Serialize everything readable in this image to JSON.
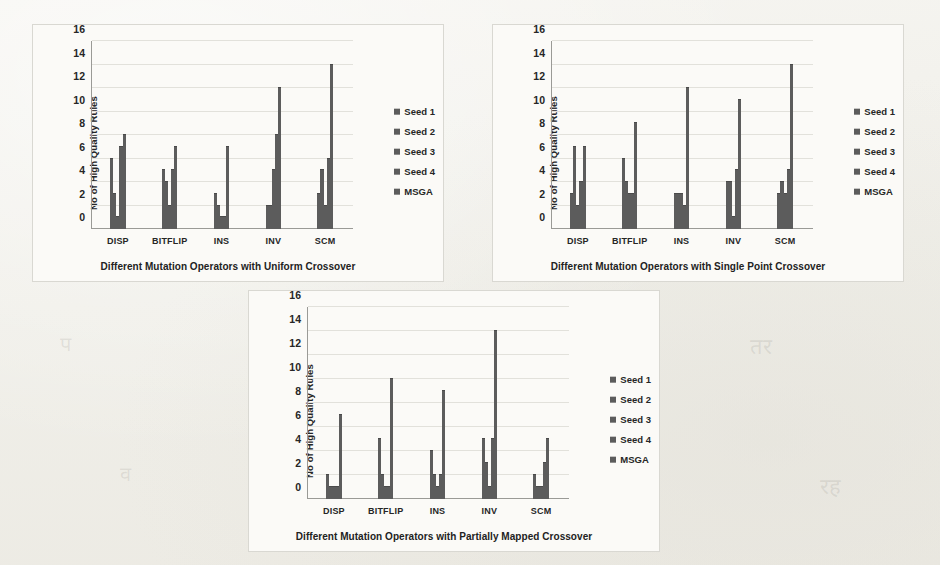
{
  "page": {
    "background_color": "#f3f2ee",
    "panel_background": "#fbfaf7",
    "bar_color": "#5c5c5c",
    "bleed_through": [
      {
        "text": "अनु",
        "x": 500,
        "y": 60,
        "size": 22
      },
      {
        "text": "हम",
        "x": 640,
        "y": 56,
        "size": 20
      },
      {
        "text": "नि",
        "x": 770,
        "y": 70,
        "size": 24
      },
      {
        "text": "दि",
        "x": 560,
        "y": 120,
        "size": 26
      },
      {
        "text": "म",
        "x": 700,
        "y": 118,
        "size": 30
      },
      {
        "text": "कर",
        "x": 520,
        "y": 180,
        "size": 22
      },
      {
        "text": "स",
        "x": 860,
        "y": 150,
        "size": 24
      },
      {
        "text": "प",
        "x": 60,
        "y": 330,
        "size": 20
      },
      {
        "text": "तर",
        "x": 750,
        "y": 330,
        "size": 22
      },
      {
        "text": "व",
        "x": 120,
        "y": 460,
        "size": 20
      },
      {
        "text": "रह",
        "x": 820,
        "y": 470,
        "size": 22
      }
    ]
  },
  "legend": {
    "items": [
      {
        "label": "Seed 1",
        "swatch": "legend-swatch-icon"
      },
      {
        "label": "Seed 2",
        "swatch": "legend-swatch-icon"
      },
      {
        "label": "Seed 3",
        "swatch": "legend-swatch-icon"
      },
      {
        "label": "Seed 4",
        "swatch": "legend-swatch-icon"
      },
      {
        "label": "MSGA",
        "swatch": "legend-swatch-icon"
      }
    ]
  },
  "axis": {
    "ylabel": "No of High Quality Rules",
    "yticks": [
      0,
      2,
      4,
      6,
      8,
      10,
      12,
      14,
      16
    ],
    "ymin": 0,
    "ymax": 16
  },
  "chart_data": [
    {
      "id": "uniform",
      "type": "bar",
      "title": "",
      "xlabel": "Different Mutation Operators  with Uniform Crossover",
      "ylabel": "No of High Quality Rules",
      "ylim": [
        0,
        16
      ],
      "ytick_step": 2,
      "grid": true,
      "legend_position": "right",
      "categories": [
        "DISP",
        "BITFLIP",
        "INS",
        "INV",
        "SCM"
      ],
      "series": [
        {
          "name": "Seed 1",
          "values": [
            6,
            5,
            3,
            2,
            3
          ]
        },
        {
          "name": "Seed 2",
          "values": [
            3,
            4,
            2,
            2,
            5
          ]
        },
        {
          "name": "Seed 3",
          "values": [
            1,
            2,
            1,
            5,
            2
          ]
        },
        {
          "name": "Seed 4",
          "values": [
            7,
            5,
            1,
            8,
            6
          ]
        },
        {
          "name": "MSGA",
          "values": [
            8,
            7,
            7,
            12,
            14
          ]
        }
      ]
    },
    {
      "id": "singlepoint",
      "type": "bar",
      "title": "",
      "xlabel": "Different Mutation Operators  with Single Point Crossover",
      "ylabel": "No of High Quality Rules",
      "ylim": [
        0,
        16
      ],
      "ytick_step": 2,
      "grid": true,
      "legend_position": "right",
      "categories": [
        "DISP",
        "BITFLIP",
        "INS",
        "INV",
        "SCM"
      ],
      "series": [
        {
          "name": "Seed 1",
          "values": [
            3,
            6,
            3,
            4,
            3
          ]
        },
        {
          "name": "Seed 2",
          "values": [
            7,
            4,
            3,
            4,
            4
          ]
        },
        {
          "name": "Seed 3",
          "values": [
            2,
            3,
            3,
            1,
            3
          ]
        },
        {
          "name": "Seed 4",
          "values": [
            4,
            3,
            2,
            5,
            5
          ]
        },
        {
          "name": "MSGA",
          "values": [
            7,
            9,
            12,
            11,
            14
          ]
        }
      ]
    },
    {
      "id": "pmx",
      "type": "bar",
      "title": "",
      "xlabel": "Different Mutation Operators with Partially Mapped Crossover",
      "ylabel": "No of High Quality Rules",
      "ylim": [
        0,
        16
      ],
      "ytick_step": 2,
      "grid": true,
      "legend_position": "right",
      "categories": [
        "DISP",
        "BITFLIP",
        "INS",
        "INV",
        "SCM"
      ],
      "series": [
        {
          "name": "Seed 1",
          "values": [
            2,
            5,
            4,
            5,
            2
          ]
        },
        {
          "name": "Seed 2",
          "values": [
            1,
            2,
            2,
            3,
            1
          ]
        },
        {
          "name": "Seed 3",
          "values": [
            1,
            1,
            1,
            1,
            1
          ]
        },
        {
          "name": "Seed 4",
          "values": [
            1,
            1,
            2,
            5,
            3
          ]
        },
        {
          "name": "MSGA",
          "values": [
            7,
            10,
            9,
            14,
            5
          ]
        }
      ]
    }
  ]
}
